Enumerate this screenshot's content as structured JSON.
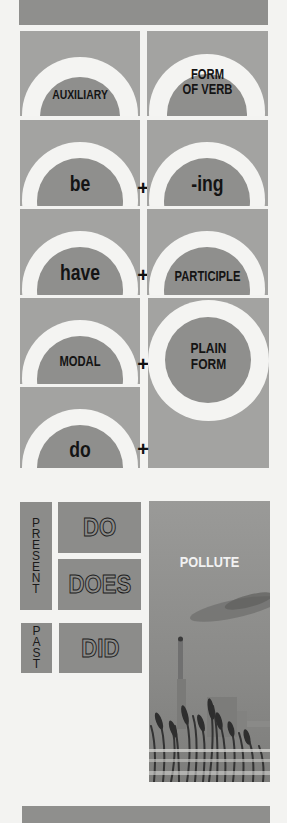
{
  "diagram": {
    "header_cells": [
      {
        "text": "AUXILIARY"
      },
      {
        "text": "FORM OF VERB",
        "lines": [
          "FORM",
          "OF VERB"
        ]
      }
    ],
    "rows": [
      {
        "auxiliary": "be",
        "connector": "+",
        "verb_form": "-ing"
      },
      {
        "auxiliary": "have",
        "connector": "+",
        "verb_form": "PARTICIPLE"
      },
      {
        "auxiliary": "MODAL",
        "connector": "+",
        "verb_form": "PLAIN FORM",
        "verb_form_lines": [
          "PLAIN",
          "FORM"
        ]
      },
      {
        "auxiliary": "do",
        "connector": "+",
        "verb_form": "PLAIN FORM (shared)"
      }
    ]
  },
  "tenses": {
    "present": {
      "label": "PRESENT",
      "letters": [
        "P",
        "R",
        "E",
        "S",
        "E",
        "N",
        "T"
      ],
      "forms": [
        "DO",
        "DOES"
      ]
    },
    "past": {
      "label": "PAST",
      "letters": [
        "P",
        "A",
        "S",
        "T"
      ],
      "forms": [
        "DID"
      ]
    }
  },
  "photo": {
    "caption": "POLLUTE",
    "description": "smokestacks and factory behind reeds"
  },
  "colors": {
    "background": "#f3f3f1",
    "dark_gray": "#8f8f8d",
    "light_gray": "#a3a3a1",
    "arch_white": "#f4f4f2",
    "text": "#141414"
  }
}
